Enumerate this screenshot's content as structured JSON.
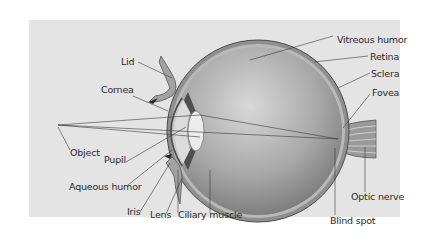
{
  "diagram": {
    "colors": {
      "background": "#e4e4e4",
      "eyeball_light": "#d0d0d0",
      "eyeball_dark": "#7a7a7a",
      "sclera": "#8f8f8f",
      "leader_line": "#3a3a3a"
    },
    "labels": {
      "lid": "Lid",
      "cornea": "Cornea",
      "object": "Object",
      "pupil": "Pupil",
      "aqueous_humor": "Aqueous humor",
      "iris": "Iris",
      "lens": "Lens",
      "ciliary_muscle": "Ciliary muscle",
      "vitreous_humor": "Vitreous humor",
      "retina": "Retina",
      "sclera": "Sclera",
      "fovea": "Fovea",
      "optic_nerve": "Optic nerve",
      "blind_spot": "Blind spot"
    }
  }
}
